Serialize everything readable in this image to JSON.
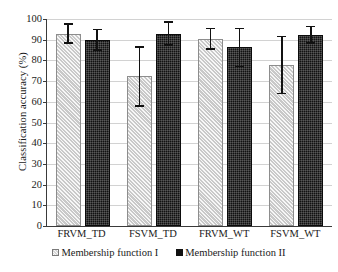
{
  "chart_data": {
    "type": "bar",
    "title": "",
    "xlabel": "",
    "ylabel": "Classification accuracy (%)",
    "ylim": [
      0,
      100
    ],
    "ytick_step": 10,
    "yticks": [
      "100",
      "90",
      "80",
      "70",
      "60",
      "50",
      "40",
      "30",
      "20",
      "10",
      "0"
    ],
    "grid": true,
    "legend_position": "bottom",
    "categories": [
      "FRVM_TD",
      "FSVM_TD",
      "FRVM_WT",
      "FSVM_WT"
    ],
    "series": [
      {
        "name": "Membership function I",
        "marker": "hatched-light-square",
        "color": "#c9c9c9",
        "values": [
          93.0,
          72.5,
          90.5,
          78.0
        ],
        "err_low": [
          88.5,
          58.0,
          85.5,
          64.0
        ],
        "err_high": [
          97.5,
          86.5,
          95.5,
          91.5
        ]
      },
      {
        "name": "Membership function II",
        "marker": "filled-black-square",
        "color": "#121212",
        "values": [
          90.0,
          93.0,
          86.5,
          92.5
        ],
        "err_low": [
          85.0,
          87.5,
          77.0,
          88.5
        ],
        "err_high": [
          95.0,
          98.5,
          95.5,
          96.5
        ]
      }
    ]
  },
  "axis": {
    "y_label": "Classification accuracy (%)"
  },
  "legend": {
    "items": [
      {
        "label": "Membership function I"
      },
      {
        "label": "Membership function II"
      }
    ]
  }
}
